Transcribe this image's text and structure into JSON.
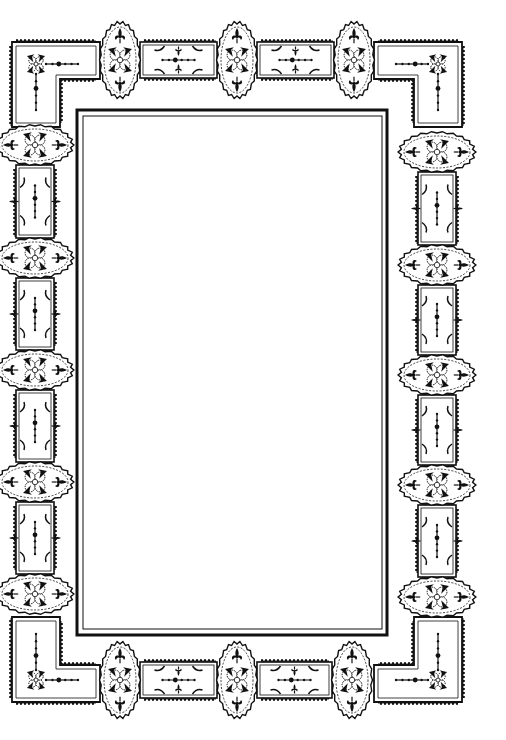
{
  "image": {
    "description": "Ornamental Victorian-style rectangular border with medallions and framed panels surrounding an empty white rectangle",
    "background": "#ffffff",
    "ink": "#111111"
  },
  "inner_frame": {
    "outer": {
      "x": 77,
      "y": 110,
      "w": 310,
      "h": 525,
      "stroke": 3
    },
    "inner": {
      "x": 83,
      "y": 116,
      "w": 299,
      "h": 513,
      "stroke": 1
    }
  },
  "corner_panels": [
    {
      "name": "top-left",
      "x": 12,
      "y": 42,
      "flipX": false,
      "flipY": false
    },
    {
      "name": "top-right",
      "x": 462,
      "y": 42,
      "flipX": true,
      "flipY": false
    },
    {
      "name": "bottom-left",
      "x": 12,
      "y": 702,
      "flipX": false,
      "flipY": true
    },
    {
      "name": "bottom-right",
      "x": 462,
      "y": 702,
      "flipX": true,
      "flipY": true
    }
  ],
  "medallions": {
    "top": [
      {
        "cx": 120,
        "cy": 60
      },
      {
        "cx": 237,
        "cy": 60
      },
      {
        "cx": 354,
        "cy": 60
      }
    ],
    "bottom": [
      {
        "cx": 120,
        "cy": 680
      },
      {
        "cx": 237,
        "cy": 680
      },
      {
        "cx": 352,
        "cy": 680
      }
    ],
    "left": [
      {
        "cx": 35,
        "cy": 145
      },
      {
        "cx": 35,
        "cy": 258
      },
      {
        "cx": 35,
        "cy": 370
      },
      {
        "cx": 35,
        "cy": 482
      },
      {
        "cx": 35,
        "cy": 594
      }
    ],
    "right": [
      {
        "cx": 437,
        "cy": 152
      },
      {
        "cx": 437,
        "cy": 265
      },
      {
        "cx": 437,
        "cy": 375
      },
      {
        "cx": 437,
        "cy": 485
      },
      {
        "cx": 437,
        "cy": 597
      }
    ]
  },
  "panels": {
    "top": [
      {
        "x1": 140,
        "x2": 217,
        "cy": 60
      },
      {
        "x1": 257,
        "x2": 334,
        "cy": 60
      }
    ],
    "bottom": [
      {
        "x1": 140,
        "x2": 217,
        "cy": 680
      },
      {
        "x1": 257,
        "x2": 332,
        "cy": 680
      }
    ],
    "left": [
      {
        "y1": 165,
        "y2": 238,
        "cx": 35
      },
      {
        "y1": 278,
        "y2": 350,
        "cx": 35
      },
      {
        "y1": 390,
        "y2": 462,
        "cx": 35
      },
      {
        "y1": 502,
        "y2": 574,
        "cx": 35
      }
    ],
    "right": [
      {
        "y1": 172,
        "y2": 245,
        "cx": 437
      },
      {
        "y1": 285,
        "y2": 355,
        "cx": 437
      },
      {
        "y1": 395,
        "y2": 465,
        "cx": 437
      },
      {
        "y1": 505,
        "y2": 577,
        "cx": 437
      }
    ]
  }
}
